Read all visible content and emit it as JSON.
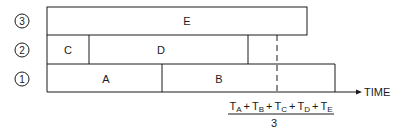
{
  "diagram": {
    "type": "timeline-gantt",
    "rows": [
      {
        "id": "3",
        "label": "3",
        "tasks": [
          {
            "name": "E",
            "start": 47,
            "end": 307
          }
        ]
      },
      {
        "id": "2",
        "label": "2",
        "tasks": [
          {
            "name": "C",
            "start": 47,
            "end": 89
          },
          {
            "name": "D",
            "start": 89,
            "end": 248
          }
        ]
      },
      {
        "id": "1",
        "label": "1",
        "tasks": [
          {
            "name": "A",
            "start": 47,
            "end": 162
          },
          {
            "name": "B",
            "start": 162,
            "end": 335
          }
        ]
      }
    ],
    "axis_label": "TIME",
    "formula": {
      "numerator_terms": [
        "A",
        "B",
        "C",
        "D",
        "E"
      ],
      "term_prefix": "T",
      "operator": "+",
      "denominator": "3"
    },
    "colors": {
      "line": "#1a1a1a",
      "background": "#ffffff"
    }
  }
}
